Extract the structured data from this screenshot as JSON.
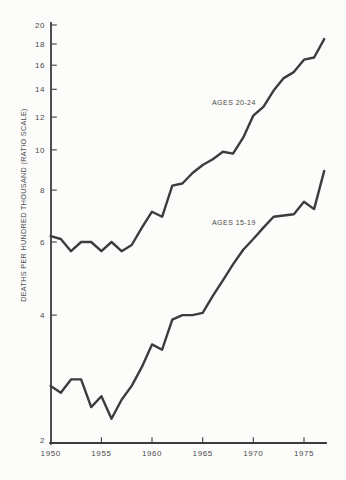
{
  "background_color": "#fcfcfa",
  "ink_color": "#3c3c3c",
  "text_color": "#4b4b4b",
  "chart_data": {
    "type": "line",
    "title": "",
    "xlabel": "",
    "ylabel": "DEATHS PER HUNDRED THOUSAND (RATIO SCALE)",
    "y_scale": "log",
    "ylim": [
      2,
      20
    ],
    "xlim": [
      1950,
      1977
    ],
    "grid": "off",
    "legend_position": "inline-labels",
    "y_ticks": [
      20,
      18,
      16,
      14,
      12,
      10,
      8,
      6,
      4,
      2
    ],
    "x_ticks": [
      1950,
      1955,
      1960,
      1965,
      1970,
      1975
    ],
    "x": [
      1950,
      1951,
      1952,
      1953,
      1954,
      1955,
      1956,
      1957,
      1958,
      1959,
      1960,
      1961,
      1962,
      1963,
      1964,
      1965,
      1966,
      1967,
      1968,
      1969,
      1970,
      1971,
      1972,
      1973,
      1974,
      1975,
      1976,
      1977
    ],
    "series": [
      {
        "name": "ages-20-24",
        "label": "AGES 20-24",
        "values": [
          6.2,
          6.1,
          5.7,
          6.0,
          6.0,
          5.7,
          6.0,
          5.7,
          5.9,
          6.5,
          7.1,
          6.9,
          8.2,
          8.3,
          8.8,
          9.2,
          9.5,
          9.9,
          9.8,
          10.7,
          12.1,
          12.7,
          13.9,
          14.9,
          15.4,
          16.5,
          16.7,
          18.5
        ]
      },
      {
        "name": "ages-15-19",
        "label": "AGES 15-19",
        "values": [
          2.7,
          2.6,
          2.8,
          2.8,
          2.4,
          2.55,
          2.25,
          2.5,
          2.7,
          3.0,
          3.4,
          3.3,
          3.9,
          4.0,
          4.0,
          4.05,
          4.45,
          4.85,
          5.3,
          5.75,
          6.1,
          6.5,
          6.9,
          6.95,
          7.0,
          7.5,
          7.2,
          8.9
        ]
      }
    ]
  }
}
